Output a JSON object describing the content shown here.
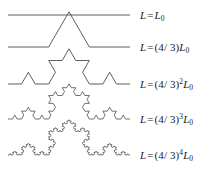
{
  "figure": {
    "background_color": "#ffffff",
    "stroke_color": "#4d4d4d",
    "stroke_width": 0.9,
    "label_color": "#1a1a1a"
  },
  "chart_data": {
    "type": "line",
    "title": "",
    "xlabel": "",
    "ylabel": "",
    "base_symbol": "L",
    "initiator_symbol": "L_0",
    "ratio": "4/3",
    "rows": [
      {
        "iteration": 0,
        "segments": 1,
        "baseline_y": 15,
        "x_start": 8,
        "x_end": 130,
        "label_x": 140,
        "label_y": 9,
        "label_plain": "L = L0",
        "label": {
          "lhs": "L",
          "equals": "=",
          "coefficient": "",
          "base": "L",
          "subscript": "0",
          "exponent": ""
        }
      },
      {
        "iteration": 1,
        "segments": 4,
        "baseline_y": 47,
        "x_start": 8,
        "x_end": 130,
        "label_x": 140,
        "label_y": 41,
        "label_plain": "L = (4/3)L0",
        "label": {
          "lhs": "L",
          "equals": "=",
          "coefficient": "(4/ 3)",
          "base": "L",
          "subscript": "0",
          "exponent": ""
        }
      },
      {
        "iteration": 2,
        "segments": 16,
        "baseline_y": 84,
        "x_start": 8,
        "x_end": 130,
        "label_x": 140,
        "label_y": 78,
        "label_plain": "L = (4/3)^2 L0",
        "label": {
          "lhs": "L",
          "equals": "=",
          "coefficient": "(4/ 3)",
          "base": "L",
          "subscript": "0",
          "exponent": "2"
        }
      },
      {
        "iteration": 3,
        "segments": 64,
        "baseline_y": 119,
        "x_start": 8,
        "x_end": 130,
        "label_x": 140,
        "label_y": 113,
        "label_plain": "L = (4/3)^3 L0",
        "label": {
          "lhs": "L",
          "equals": "=",
          "coefficient": "(4/ 3)",
          "base": "L",
          "subscript": "0",
          "exponent": "3"
        }
      },
      {
        "iteration": 4,
        "segments": 256,
        "baseline_y": 155,
        "x_start": 8,
        "x_end": 130,
        "label_x": 140,
        "label_y": 149,
        "label_plain": "L = (4/3)^4 L0",
        "label": {
          "lhs": "L",
          "equals": "=",
          "coefficient": "(4/ 3)",
          "base": "L",
          "subscript": "0",
          "exponent": "4"
        }
      }
    ]
  }
}
